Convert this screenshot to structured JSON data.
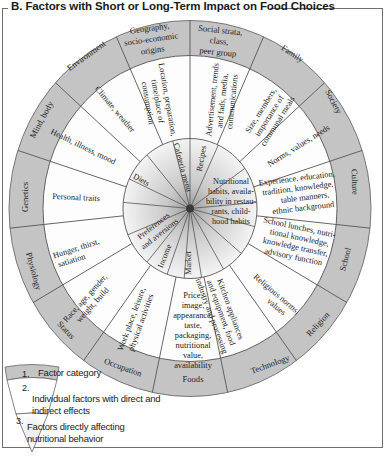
{
  "title": "B. Factors with Short or Long-Term Impact on Food Choices",
  "colors": {
    "ring_fill": "#c4c4c4",
    "line": "#555555",
    "middle_fill": "#ffffff",
    "center_dot": "#3a3a3a",
    "frame": "#6f6f6f"
  },
  "wheel": {
    "factor_categories": [
      "Social strata, class, peer group",
      "Family",
      "Society",
      "Culture",
      "School",
      "Religion",
      "Technology",
      "Foods",
      "Occupation",
      "Status",
      "Physiology",
      "Genetics",
      "Mind, body",
      "Environment",
      "Geography, socio-economic origins"
    ],
    "individual_factors": [
      "Advertisement, trends and fads, media, communications",
      "Size, members, importance of communal meals",
      "Norms, values, needs",
      "Experience, education, tradition, knowledge, table manners, ethnic background",
      "School lunches, nutritional knowledge, knowledge transfer, advisory function",
      "Religious norms, values",
      "Kitchen appliances and equipment, food industry and processing",
      "Price, image, appearance, taste, packaging, nutritional value, availability",
      "Work place, leisure, physical activities",
      "Race, age, gender, weight, build",
      "Hunger, thirst, satiation",
      "Personal traits",
      "Health, illness, mood",
      "Climate, weather",
      "Location, preparation, time/place of consumption"
    ],
    "direct_factors": [
      "Recipes",
      "Nutritional habits, availability in restaurants, childhood habits",
      "Market",
      "Income",
      "Preferences and aversions",
      "Diets",
      "Cafeteria menu"
    ]
  },
  "legend": {
    "items": [
      {
        "number": "1.",
        "label": "Factor category"
      },
      {
        "number": "2.",
        "label": "Individual factors with direct and indirect effects"
      },
      {
        "number": "3.",
        "label": "Factors directly affecting nutritional behavior"
      }
    ]
  }
}
